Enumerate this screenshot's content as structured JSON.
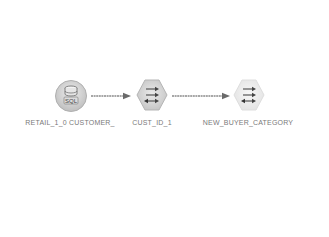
{
  "diagram": {
    "type": "etl-data-flow",
    "nodes": [
      {
        "id": "source",
        "label": "RETAIL_1_0 CUSTOMER_",
        "icon": "sql-database-icon",
        "kind": "source"
      },
      {
        "id": "transform",
        "label": "CUST_ID_1",
        "icon": "transform-hexagon-icon",
        "kind": "transform"
      },
      {
        "id": "target",
        "label": "NEW_BUYER_CATEGORY",
        "icon": "target-hexagon-icon",
        "kind": "target"
      }
    ],
    "edges": [
      {
        "from": "source",
        "to": "transform"
      },
      {
        "from": "transform",
        "to": "target"
      }
    ],
    "sql_badge": "SQL"
  },
  "colors": {
    "background": "#ffffff",
    "node_fill": "#d9d9d9",
    "node_fill_light": "#ececec",
    "node_stroke": "#bdbdbd",
    "glyph": "#555555",
    "edge": "#707070",
    "label": "#7a7a7a"
  }
}
